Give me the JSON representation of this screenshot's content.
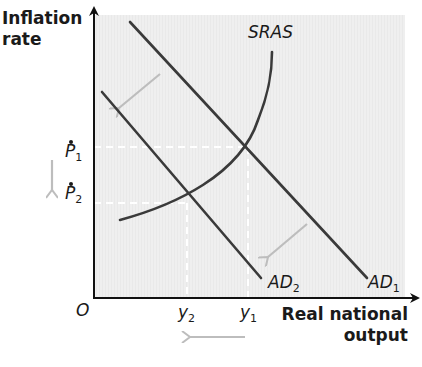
{
  "diagram": {
    "y_axis_label_line1": "Inflation",
    "y_axis_label_line2": "rate",
    "x_axis_label_line1": "Real national",
    "x_axis_label_line2": "output",
    "origin_label": "O",
    "curves": {
      "sras": {
        "label": "SRAS"
      },
      "ad1": {
        "label": "AD",
        "sub": "1"
      },
      "ad2": {
        "label": "AD",
        "sub": "2"
      }
    },
    "price_levels": {
      "p1": {
        "label": "P",
        "sub": "1"
      },
      "p2": {
        "label": "P",
        "sub": "2"
      }
    },
    "outputs": {
      "y1": {
        "label": "y",
        "sub": "1"
      },
      "y2": {
        "label": "y",
        "sub": "2"
      }
    },
    "shift_arrows": [
      "AD1 to AD2 leftward shift (upper)",
      "AD1 to AD2 leftward shift (lower)",
      "Inflation falls P1 to P2",
      "Output falls y1 to y2"
    ],
    "colors": {
      "plot_bg": "#efefef",
      "curve": "#3a3a3a",
      "axis": "#111111",
      "shift_arrow": "#bdbdbd",
      "guide_line": "#ffffff"
    }
  }
}
